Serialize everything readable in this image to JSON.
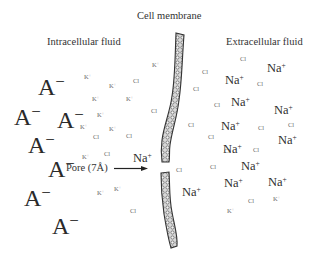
{
  "labels": {
    "membrane": "Cell membrane",
    "intracellular": "Intracellular fluid",
    "extracellular": "Extracellular fluid",
    "pore": "Pore (7Å)"
  },
  "ions": {
    "anion": {
      "base": "A",
      "charge": "−"
    },
    "potassium": {
      "base": "K",
      "charge": "+"
    },
    "sodium": {
      "base": "Na",
      "charge": "+"
    },
    "chloride": {
      "base": "Cl",
      "charge": ""
    }
  },
  "intracellular_ions": [
    {
      "type": "anion",
      "size": "big",
      "x": 38,
      "y": 75
    },
    {
      "type": "anion",
      "size": "big",
      "x": 14,
      "y": 105
    },
    {
      "type": "anion",
      "size": "big",
      "x": 57,
      "y": 108
    },
    {
      "type": "anion",
      "size": "big",
      "x": 28,
      "y": 133
    },
    {
      "type": "anion",
      "size": "big",
      "x": 48,
      "y": 157
    },
    {
      "type": "anion",
      "size": "big",
      "x": 24,
      "y": 186
    },
    {
      "type": "anion",
      "size": "big",
      "x": 52,
      "y": 214
    },
    {
      "type": "potassium",
      "size": "sm",
      "x": 152,
      "y": 62
    },
    {
      "type": "potassium",
      "size": "sm",
      "x": 84,
      "y": 74
    },
    {
      "type": "potassium",
      "size": "sm",
      "x": 109,
      "y": 83
    },
    {
      "type": "potassium",
      "size": "sm",
      "x": 92,
      "y": 96
    },
    {
      "type": "potassium",
      "size": "sm",
      "x": 126,
      "y": 96
    },
    {
      "type": "potassium",
      "size": "sm",
      "x": 97,
      "y": 112
    },
    {
      "type": "potassium",
      "size": "sm",
      "x": 80,
      "y": 124
    },
    {
      "type": "potassium",
      "size": "sm",
      "x": 109,
      "y": 126
    },
    {
      "type": "potassium",
      "size": "sm",
      "x": 82,
      "y": 154
    },
    {
      "type": "potassium",
      "size": "sm",
      "x": 97,
      "y": 190
    },
    {
      "type": "potassium",
      "size": "sm",
      "x": 114,
      "y": 186
    },
    {
      "type": "chloride",
      "size": "sm",
      "x": 133,
      "y": 78
    },
    {
      "type": "chloride",
      "size": "sm",
      "x": 151,
      "y": 108
    },
    {
      "type": "chloride",
      "size": "sm",
      "x": 93,
      "y": 134
    },
    {
      "type": "chloride",
      "size": "sm",
      "x": 126,
      "y": 133
    },
    {
      "type": "chloride",
      "size": "sm",
      "x": 104,
      "y": 151
    },
    {
      "type": "chloride",
      "size": "sm",
      "x": 130,
      "y": 208
    },
    {
      "type": "sodium",
      "size": "na",
      "x": 133,
      "y": 152
    }
  ],
  "extracellular_ions": [
    {
      "type": "chloride",
      "size": "sm",
      "x": 240,
      "y": 56
    },
    {
      "type": "chloride",
      "size": "sm",
      "x": 202,
      "y": 69
    },
    {
      "type": "chloride",
      "size": "sm",
      "x": 193,
      "y": 86
    },
    {
      "type": "chloride",
      "size": "sm",
      "x": 257,
      "y": 81
    },
    {
      "type": "chloride",
      "size": "sm",
      "x": 214,
      "y": 102
    },
    {
      "type": "chloride",
      "size": "sm",
      "x": 188,
      "y": 122
    },
    {
      "type": "chloride",
      "size": "sm",
      "x": 258,
      "y": 125
    },
    {
      "type": "chloride",
      "size": "sm",
      "x": 288,
      "y": 122
    },
    {
      "type": "chloride",
      "size": "sm",
      "x": 208,
      "y": 134
    },
    {
      "type": "chloride",
      "size": "sm",
      "x": 224,
      "y": 148
    },
    {
      "type": "chloride",
      "size": "sm",
      "x": 253,
      "y": 147
    },
    {
      "type": "chloride",
      "size": "sm",
      "x": 176,
      "y": 167
    },
    {
      "type": "chloride",
      "size": "sm",
      "x": 210,
      "y": 164
    },
    {
      "type": "chloride",
      "size": "sm",
      "x": 248,
      "y": 198
    },
    {
      "type": "potassium",
      "size": "sm",
      "x": 273,
      "y": 196
    },
    {
      "type": "potassium",
      "size": "sm",
      "x": 227,
      "y": 208
    },
    {
      "type": "sodium",
      "size": "na",
      "x": 267,
      "y": 62
    },
    {
      "type": "sodium",
      "size": "na",
      "x": 225,
      "y": 74
    },
    {
      "type": "sodium",
      "size": "na",
      "x": 231,
      "y": 96
    },
    {
      "type": "sodium",
      "size": "na",
      "x": 274,
      "y": 104
    },
    {
      "type": "sodium",
      "size": "na",
      "x": 221,
      "y": 120
    },
    {
      "type": "sodium",
      "size": "na",
      "x": 278,
      "y": 134
    },
    {
      "type": "sodium",
      "size": "na",
      "x": 223,
      "y": 143
    },
    {
      "type": "sodium",
      "size": "na",
      "x": 241,
      "y": 160
    },
    {
      "type": "sodium",
      "size": "na",
      "x": 224,
      "y": 177
    },
    {
      "type": "sodium",
      "size": "na",
      "x": 268,
      "y": 176
    },
    {
      "type": "sodium",
      "size": "na",
      "x": 182,
      "y": 186
    }
  ]
}
